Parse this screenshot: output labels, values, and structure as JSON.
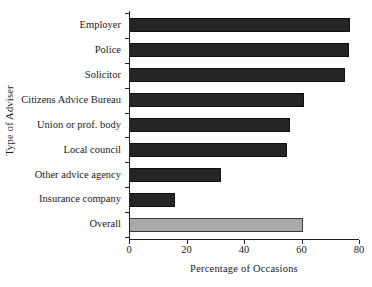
{
  "chart_data": {
    "type": "bar",
    "orientation": "horizontal",
    "title": "",
    "xlabel": "Percentage of Occasions",
    "ylabel": "Type of Adviser",
    "categories": [
      "Employer",
      "Police",
      "Solicitor",
      "Citizens Advice Bureau",
      "Union or prof. body",
      "Local council",
      "Other advice agency",
      "Insurance company",
      "Overall"
    ],
    "values": [
      77,
      76.5,
      75,
      61,
      56,
      55,
      32,
      16,
      60.5
    ],
    "xlim": [
      0,
      80
    ],
    "xticks": [
      0,
      20,
      40,
      60,
      80
    ],
    "xtick_labels": [
      "0",
      "20",
      "40",
      "60",
      "80"
    ],
    "grid": false,
    "legend": false,
    "bar_color": "#252525",
    "highlight_color": "#a9a9a9",
    "highlight_category": "Overall"
  }
}
